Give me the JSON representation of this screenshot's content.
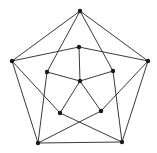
{
  "diagram": {
    "type": "graph",
    "colors": {
      "edge": "#3a3a3a",
      "node": "#1a1a1a",
      "background": "#ffffff"
    },
    "node_radius": 2.2,
    "nodes": [
      {
        "id": "top",
        "x": 80,
        "y": 11
      },
      {
        "id": "right",
        "x": 148,
        "y": 61
      },
      {
        "id": "bottom-right",
        "x": 122,
        "y": 142
      },
      {
        "id": "bottom-left",
        "x": 38,
        "y": 143
      },
      {
        "id": "left",
        "x": 12,
        "y": 61
      },
      {
        "id": "inner-top",
        "x": 79,
        "y": 47
      },
      {
        "id": "inner-right",
        "x": 113,
        "y": 71
      },
      {
        "id": "inner-bottom-right",
        "x": 101,
        "y": 111
      },
      {
        "id": "inner-bottom-left",
        "x": 60,
        "y": 113
      },
      {
        "id": "inner-left",
        "x": 47,
        "y": 72
      },
      {
        "id": "center",
        "x": 80,
        "y": 81
      }
    ],
    "edges": [
      [
        "top",
        "right"
      ],
      [
        "right",
        "bottom-right"
      ],
      [
        "bottom-right",
        "bottom-left"
      ],
      [
        "bottom-left",
        "left"
      ],
      [
        "left",
        "top"
      ],
      [
        "top",
        "inner-left"
      ],
      [
        "top",
        "inner-right"
      ],
      [
        "left",
        "inner-top"
      ],
      [
        "right",
        "inner-top"
      ],
      [
        "left",
        "inner-bottom-left"
      ],
      [
        "right",
        "inner-bottom-right"
      ],
      [
        "bottom-left",
        "inner-left"
      ],
      [
        "bottom-right",
        "inner-right"
      ],
      [
        "bottom-left",
        "inner-bottom-right"
      ],
      [
        "bottom-right",
        "inner-bottom-left"
      ],
      [
        "inner-top",
        "center"
      ],
      [
        "inner-left",
        "center"
      ],
      [
        "inner-right",
        "center"
      ],
      [
        "inner-bottom-left",
        "center"
      ],
      [
        "inner-bottom-right",
        "center"
      ]
    ]
  }
}
